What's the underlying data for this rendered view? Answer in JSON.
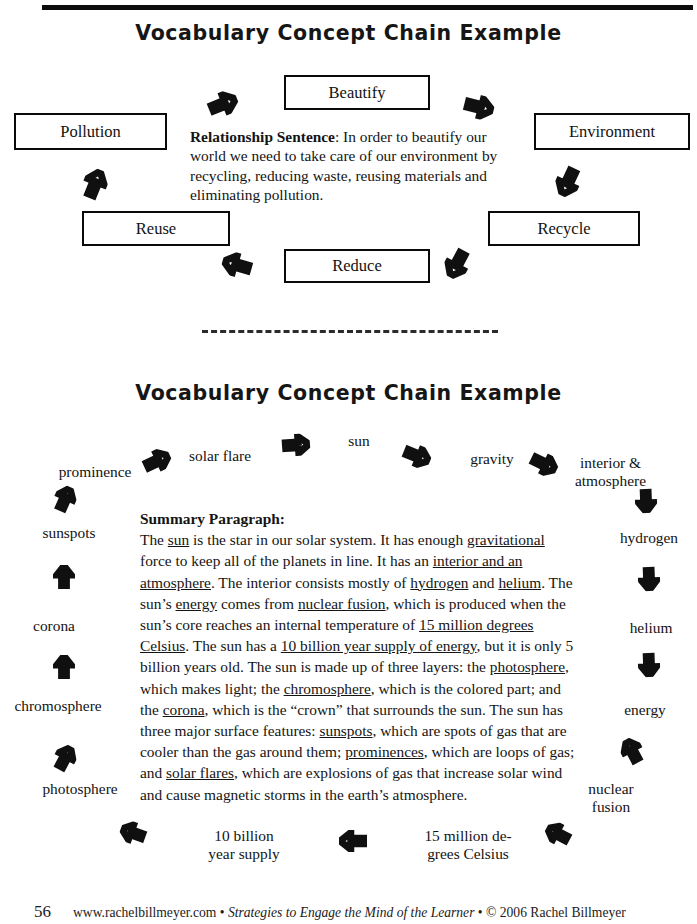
{
  "page": {
    "number": "56",
    "footer_site": "www.rachelbillmeyer.com",
    "footer_sep1": "•",
    "footer_title": "Strategies to Engage the Mind of the Learner",
    "footer_sep2": "•",
    "footer_copyright": "© 2006 Rachel Billmeyer"
  },
  "section1": {
    "title": "Vocabulary Concept Chain Example",
    "boxes": [
      {
        "id": "beautify",
        "label": "Beautify"
      },
      {
        "id": "environment",
        "label": "Environment"
      },
      {
        "id": "recycle",
        "label": "Recycle"
      },
      {
        "id": "reduce",
        "label": "Reduce"
      },
      {
        "id": "reuse",
        "label": "Reuse"
      },
      {
        "id": "pollution",
        "label": "Pollution"
      }
    ],
    "relationship": {
      "heading": "Relationship Sentence",
      "colon": ":",
      "text": "  In order to beautify our world we need to take care of our environment by recycling, reducing waste, reusing materials and eliminating pollution."
    },
    "arrows": [
      {
        "name": "arrow-pollution-to-beautify",
        "direction": "up-right"
      },
      {
        "name": "arrow-beautify-to-environment",
        "direction": "right"
      },
      {
        "name": "arrow-environment-to-recycle",
        "direction": "down-right"
      },
      {
        "name": "arrow-recycle-to-reduce",
        "direction": "down-left"
      },
      {
        "name": "arrow-reduce-to-reuse",
        "direction": "left"
      },
      {
        "name": "arrow-reuse-to-pollution",
        "direction": "up-left"
      }
    ]
  },
  "section2": {
    "title": "Vocabulary Concept Chain Example",
    "words": [
      {
        "id": "prominence",
        "label": "prominence"
      },
      {
        "id": "solar-flare",
        "label": "solar flare"
      },
      {
        "id": "sun",
        "label": "sun"
      },
      {
        "id": "gravity",
        "label": "gravity"
      },
      {
        "id": "interior-atmosphere",
        "label": "interior &\natmosphere"
      },
      {
        "id": "hydrogen",
        "label": "hydrogen"
      },
      {
        "id": "helium",
        "label": "helium"
      },
      {
        "id": "energy",
        "label": "energy"
      },
      {
        "id": "nuclear-fusion",
        "label": "nuclear\nfusion"
      },
      {
        "id": "15-million-degrees",
        "label": "15 million de-\ngrees Celsius"
      },
      {
        "id": "10-billion-year-supply",
        "label": "10 billion\nyear supply"
      },
      {
        "id": "photosphere",
        "label": "photosphere"
      },
      {
        "id": "chromosphere",
        "label": "chromosphere"
      },
      {
        "id": "corona",
        "label": "corona"
      },
      {
        "id": "sunspots",
        "label": "sunspots"
      }
    ],
    "summary": {
      "heading": "Summary Paragraph:",
      "segments": [
        {
          "t": "The ",
          "u": false
        },
        {
          "t": "sun",
          "u": true
        },
        {
          "t": " is the star in our solar system.  It has enough ",
          "u": false
        },
        {
          "t": "gravitational",
          "u": true
        },
        {
          "t": " force to keep all of the planets in line.  It has an ",
          "u": false
        },
        {
          "t": "interior and an atmosphere",
          "u": true
        },
        {
          "t": ".  The interior consists mostly of ",
          "u": false
        },
        {
          "t": "hydrogen",
          "u": true
        },
        {
          "t": " and ",
          "u": false
        },
        {
          "t": "helium",
          "u": true
        },
        {
          "t": ".  The sun’s ",
          "u": false
        },
        {
          "t": "energy",
          "u": true
        },
        {
          "t": " comes from ",
          "u": false
        },
        {
          "t": "nuclear fusion",
          "u": true
        },
        {
          "t": ", which is produced when the sun’s core reaches an internal temperature of ",
          "u": false
        },
        {
          "t": "15 million degrees Celsius",
          "u": true
        },
        {
          "t": ".  The sun has a ",
          "u": false
        },
        {
          "t": "10 billion year supply of energy",
          "u": true
        },
        {
          "t": ", but it is only 5 billion years old.  The sun is made up of three layers:  the ",
          "u": false
        },
        {
          "t": "photosphere",
          "u": true
        },
        {
          "t": ", which makes light; the ",
          "u": false
        },
        {
          "t": "chromosphere",
          "u": true
        },
        {
          "t": ", which is the colored part; and the ",
          "u": false
        },
        {
          "t": "corona",
          "u": true
        },
        {
          "t": ", which is the “crown” that surrounds the sun.  The sun has three major surface features:  ",
          "u": false
        },
        {
          "t": "sunspots",
          "u": true
        },
        {
          "t": ", which are spots of gas that are cooler than the gas around them; ",
          "u": false
        },
        {
          "t": "prominences",
          "u": true
        },
        {
          "t": ", which are loops of gas; and ",
          "u": false
        },
        {
          "t": "solar flares",
          "u": true
        },
        {
          "t": ", which are explosions of gas that increase solar wind and cause magnetic storms in the earth’s atmosphere.",
          "u": false
        }
      ]
    },
    "arrows": [
      {
        "name": "arrow-sunspots-to-prominence",
        "direction": "up-right"
      },
      {
        "name": "arrow-prominence-to-solar-flare",
        "direction": "up-right"
      },
      {
        "name": "arrow-solar-flare-to-sun",
        "direction": "right"
      },
      {
        "name": "arrow-sun-to-gravity",
        "direction": "down-right"
      },
      {
        "name": "arrow-gravity-to-interior",
        "direction": "down-right"
      },
      {
        "name": "arrow-interior-to-hydrogen",
        "direction": "down"
      },
      {
        "name": "arrow-hydrogen-to-helium",
        "direction": "down"
      },
      {
        "name": "arrow-helium-to-energy",
        "direction": "down"
      },
      {
        "name": "arrow-energy-to-nuclear-fusion",
        "direction": "down-left"
      },
      {
        "name": "arrow-fusion-to-15-million",
        "direction": "down-left"
      },
      {
        "name": "arrow-15-million-to-10-billion",
        "direction": "left"
      },
      {
        "name": "arrow-10-billion-to-photosphere",
        "direction": "left"
      },
      {
        "name": "arrow-photosphere-to-chromosphere",
        "direction": "up-right"
      },
      {
        "name": "arrow-chromosphere-to-corona",
        "direction": "up"
      },
      {
        "name": "arrow-corona-to-sunspots",
        "direction": "up"
      }
    ]
  },
  "colors": {
    "ink": "#121212",
    "paper": "#ffffff",
    "rule": "#0d0d0d"
  }
}
